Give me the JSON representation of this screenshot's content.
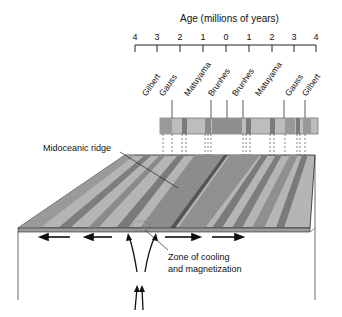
{
  "axis": {
    "title": "Age (millions of years)",
    "ticks": [
      "4",
      "3",
      "2",
      "1",
      "0",
      "1",
      "2",
      "3",
      "4"
    ]
  },
  "epochs": [
    "Gilbert",
    "Gauss",
    "Matuyama",
    "Brunhes",
    "Brunhes",
    "Matuyama",
    "Gauss",
    "Gilbert"
  ],
  "labels": {
    "ridge": "Midoceanic ridge",
    "zone_line1": "Zone of cooling",
    "zone_line2": "and magnetization"
  },
  "colors": {
    "normal": "#8f8f8f",
    "reversed": "#c4c4c4",
    "outline": "#222222"
  }
}
